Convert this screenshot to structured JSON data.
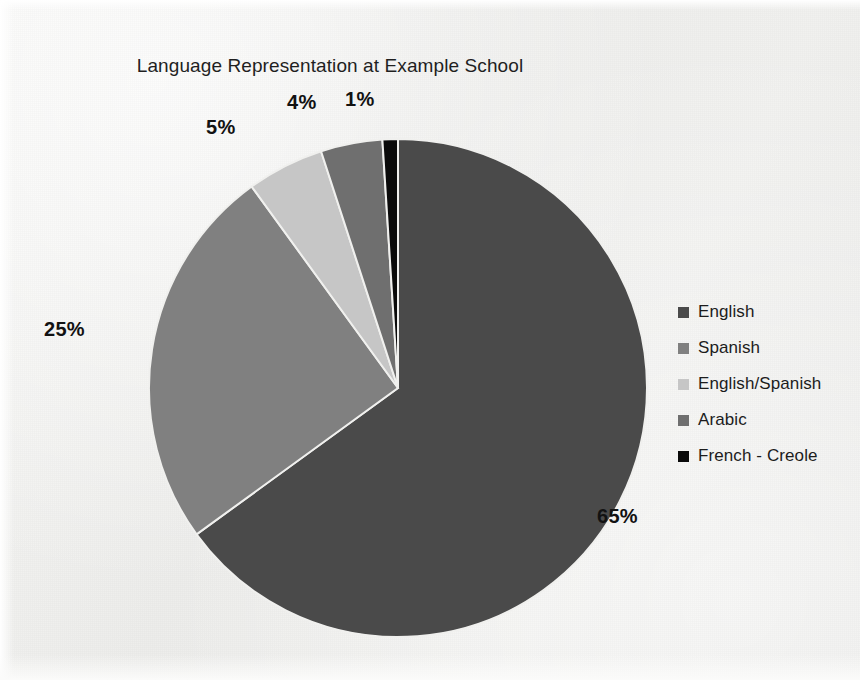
{
  "chart_data": {
    "type": "pie",
    "title": "Language Representation at Example School",
    "xlabel": "",
    "ylabel": "",
    "legend_position": "right",
    "grid": false,
    "categories": [
      "English",
      "Spanish",
      "English/Spanish",
      "Arabic",
      "French - Creole"
    ],
    "values": [
      65,
      25,
      5,
      4,
      1
    ],
    "value_labels": [
      "65%",
      "25%",
      "5%",
      "4%",
      "1%"
    ],
    "value_unit": "%",
    "colors": [
      "#4a4a4a",
      "#808080",
      "#c6c6c6",
      "#6f6f6f",
      "#0a0a0a"
    ],
    "slices": [
      {
        "label": "English",
        "value": 65,
        "display": "65%",
        "color": "#4a4a4a"
      },
      {
        "label": "Spanish",
        "value": 25,
        "display": "25%",
        "color": "#808080"
      },
      {
        "label": "English/Spanish",
        "value": 5,
        "display": "5%",
        "color": "#c6c6c6"
      },
      {
        "label": "Arabic",
        "value": 4,
        "display": "4%",
        "color": "#6f6f6f"
      },
      {
        "label": "French - Creole",
        "value": 1,
        "display": "1%",
        "color": "#0a0a0a"
      }
    ]
  },
  "legend": {
    "items": [
      {
        "label": "English",
        "color": "#4a4a4a"
      },
      {
        "label": "Spanish",
        "color": "#808080"
      },
      {
        "label": "English/Spanish",
        "color": "#c6c6c6"
      },
      {
        "label": "Arabic",
        "color": "#6f6f6f"
      },
      {
        "label": "French - Creole",
        "color": "#0a0a0a"
      }
    ]
  },
  "labels": {
    "english": "65%",
    "spanish": "25%",
    "english_spanish": "5%",
    "arabic": "4%",
    "french_creole": "1%"
  }
}
